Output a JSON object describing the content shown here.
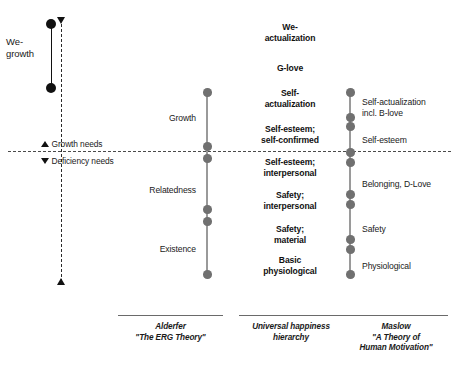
{
  "diagram": {
    "divider": {
      "above_label": "Growth needs",
      "below_label": "Deficiency needs",
      "above_marker": "triangle-up-icon",
      "below_marker": "triangle-down-icon"
    },
    "left_axis": {
      "label": "We-\ngrowth",
      "label_line1": "We-",
      "label_line2": "growth",
      "top_marker": "triangle-down-icon",
      "bottom_marker": "triangle-up-icon"
    },
    "colors": {
      "accent_dot": "#707070",
      "accent_line": "#9a9a9a",
      "black": "#111111",
      "divider": "#4a4a4a"
    },
    "columns": [
      {
        "id": "alderfer",
        "caption_line1": "Alderfer",
        "caption_line2": "\"The ERG Theory\"",
        "stages": [
          {
            "label": "Growth"
          },
          {
            "label": "Relatedness"
          },
          {
            "label": "Existence"
          }
        ]
      },
      {
        "id": "universal-happiness",
        "caption_line1": "Universal happiness",
        "caption_line2": "hierarchy",
        "stages": [
          {
            "label_line1": "We-",
            "label_line2": "actualization"
          },
          {
            "label_line1": "G-love",
            "label_line2": ""
          },
          {
            "label_line1": "Self-",
            "label_line2": "actualization"
          },
          {
            "label_line1": "Self-esteem;",
            "label_line2": "self-confirmed"
          },
          {
            "label_line1": "Self-esteem;",
            "label_line2": "interpersonal"
          },
          {
            "label_line1": "Safety;",
            "label_line2": "interpersonal"
          },
          {
            "label_line1": "Safety;",
            "label_line2": "material"
          },
          {
            "label_line1": "Basic",
            "label_line2": "physiological"
          }
        ]
      },
      {
        "id": "maslow",
        "caption_line1": "Maslow",
        "caption_line2": "\"A Theory of",
        "caption_line3": "Human Motivation\"",
        "stages": [
          {
            "label_line1": "Self-actualization",
            "label_line2": "incl. B-love"
          },
          {
            "label_line1": "Self-esteem",
            "label_line2": ""
          },
          {
            "label_line1": "Belonging, D-Love",
            "label_line2": ""
          },
          {
            "label_line1": "Safety",
            "label_line2": ""
          },
          {
            "label_line1": "Physiological",
            "label_line2": ""
          }
        ]
      }
    ]
  }
}
